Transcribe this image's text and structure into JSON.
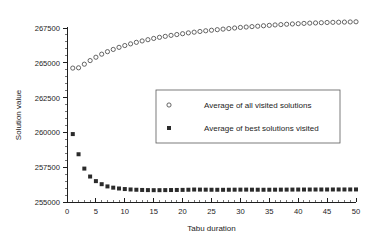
{
  "figure": {
    "corner_mark": "",
    "background": "#ffffff"
  },
  "chart_data": {
    "type": "scatter",
    "title": "",
    "xlabel": "Tabu duration",
    "ylabel": "Solution value",
    "xlim": [
      0,
      50
    ],
    "ylim": [
      255000,
      267500
    ],
    "xticks": [
      0,
      5,
      10,
      15,
      20,
      25,
      30,
      35,
      40,
      45,
      50
    ],
    "xtick_labels": [
      "0",
      "5",
      "10",
      "15",
      "20",
      "25",
      "30",
      "35",
      "40",
      "45",
      "50"
    ],
    "x_minor_tick_step": 1,
    "yticks": [
      255000,
      257500,
      260000,
      262500,
      265000,
      267500
    ],
    "ytick_labels": [
      "255000",
      "257500",
      "260000",
      "262500",
      "265000",
      "267500"
    ],
    "y_minor_tick_step": 500,
    "grid": false,
    "legend_position": "center-right-upper",
    "x": [
      1,
      2,
      3,
      4,
      5,
      6,
      7,
      8,
      9,
      10,
      11,
      12,
      13,
      14,
      15,
      16,
      17,
      18,
      19,
      20,
      21,
      22,
      23,
      24,
      25,
      26,
      27,
      28,
      29,
      30,
      31,
      32,
      33,
      34,
      35,
      36,
      37,
      38,
      39,
      40,
      41,
      42,
      43,
      44,
      45,
      46,
      47,
      48,
      49,
      50
    ],
    "series": [
      {
        "name": "Average of all visited solutions",
        "marker": "open-circle",
        "color": "#4a4a4a",
        "values": [
          264620,
          264640,
          264900,
          265160,
          265400,
          265620,
          265800,
          265960,
          266110,
          266240,
          266360,
          266470,
          266570,
          266660,
          266750,
          266830,
          266900,
          266970,
          267030,
          267090,
          267150,
          267200,
          267250,
          267300,
          267340,
          267380,
          267420,
          267460,
          267500,
          267540,
          267570,
          267600,
          267630,
          267660,
          267690,
          267720,
          267745,
          267770,
          267790,
          267810,
          267830,
          267850,
          267865,
          267880,
          267895,
          267905,
          267915,
          267925,
          267935,
          267945
        ]
      },
      {
        "name": "Average of best solutions visited",
        "marker": "filled-square",
        "color": "#2b2b2b",
        "values": [
          259880,
          258430,
          257400,
          256830,
          256500,
          256280,
          256120,
          256030,
          255970,
          255930,
          255900,
          255880,
          255865,
          255855,
          255850,
          255850,
          255855,
          255860,
          255865,
          255870,
          255880,
          255895,
          255890,
          255885,
          255880,
          255878,
          255876,
          255880,
          255885,
          255888,
          255890,
          255885,
          255882,
          255880,
          255882,
          255885,
          255888,
          255890,
          255892,
          255895,
          255895,
          255896,
          255897,
          255898,
          255898,
          255899,
          255900,
          255900,
          255901,
          255902
        ]
      }
    ]
  },
  "legend": {
    "entries": [
      {
        "label": "Average of all visited solutions",
        "marker": "open-circle"
      },
      {
        "label": "Average of best solutions visited",
        "marker": "filled-square"
      }
    ]
  }
}
